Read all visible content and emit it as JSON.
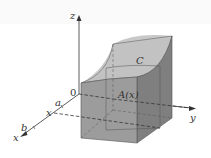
{
  "figure": {
    "type": "3d-solid-cross-section",
    "labels": {
      "z_axis": "z",
      "y_axis": "y",
      "x_axis": "x",
      "origin": "0",
      "a": "a",
      "b": "b",
      "x_tick": "x",
      "curve": "C",
      "cross_section": "A(x)"
    },
    "colors": {
      "solid_fill": "#9a9a9a",
      "solid_top": "#c4c4c4",
      "solid_side": "#7e7e7e",
      "axis": "#333333",
      "edge": "#555555"
    }
  }
}
